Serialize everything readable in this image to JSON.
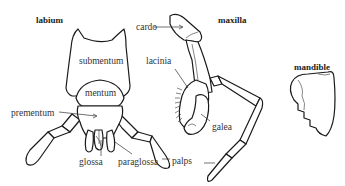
{
  "figure": {
    "parts": [
      {
        "id": "labium",
        "title": "labium",
        "labels": [
          "submentum",
          "mentum",
          "prementum",
          "glossa",
          "paraglossa"
        ]
      },
      {
        "id": "maxilla",
        "title": "maxilla",
        "labels": [
          "cardo",
          "lacinia",
          "galea",
          "palps"
        ]
      },
      {
        "id": "mandible",
        "title": "mandible",
        "labels": []
      }
    ]
  },
  "colors": {
    "outline": "#1a1a1a",
    "text": "#333333",
    "background": "#ffffff"
  }
}
